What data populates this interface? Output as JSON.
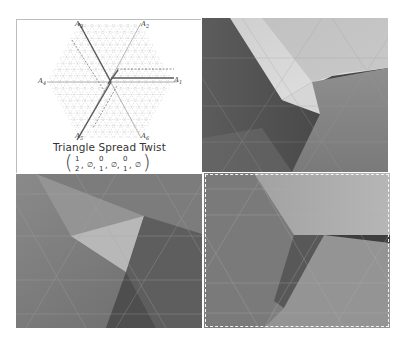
{
  "figure": {
    "diagram": {
      "title": "Triangle Spread Twist",
      "tuple": {
        "open": "(",
        "close": ")",
        "entries": [
          {
            "top": "1",
            "bottom": "2"
          },
          {
            "sep": ",",
            "value": "∅"
          },
          {
            "top": "0",
            "bottom": "1"
          },
          {
            "sep": ",",
            "value": "∅"
          },
          {
            "top": "0",
            "bottom": "1"
          },
          {
            "sep": ",",
            "value": "∅"
          }
        ],
        "text": "(1/2, ∅, 0/1, ∅, 0/1, ∅)"
      },
      "axes": [
        {
          "id": "A1",
          "base": "A",
          "sub": "1",
          "position": "right"
        },
        {
          "id": "A2",
          "base": "A",
          "sub": "2",
          "position": "top-right"
        },
        {
          "id": "A3",
          "base": "A",
          "sub": "3",
          "position": "top-left"
        },
        {
          "id": "A4",
          "base": "A",
          "sub": "4",
          "position": "left"
        },
        {
          "id": "A5",
          "base": "A",
          "sub": "5",
          "position": "bottom-left"
        },
        {
          "id": "A6",
          "base": "A",
          "sub": "6",
          "position": "bottom-right"
        }
      ],
      "grid": "triangular",
      "shape": "hexagon"
    },
    "photos": [
      {
        "id": "top-right",
        "subject": "folded paper triangle spread twist, close-up"
      },
      {
        "id": "bottom-left",
        "subject": "folded paper triangular flap on triangle grid"
      },
      {
        "id": "bottom-right",
        "subject": "folded paper tessellation with horizontal pleat",
        "border": "dashed"
      }
    ],
    "colors": {
      "grid_line": "#b8b8b8",
      "axis_line": "#555555",
      "text": "#333333",
      "background": "#ffffff"
    }
  }
}
